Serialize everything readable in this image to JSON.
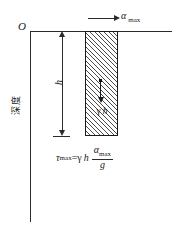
{
  "figure": {
    "axes": {
      "origin_label": "O",
      "depth_axis_label": "深度"
    },
    "top_arrow": {
      "icon": "right-arrow-icon",
      "symbol": "α",
      "subscript": "max",
      "label": "α max"
    },
    "column": {
      "hatch_style": "diagonal-45",
      "height_dimension": {
        "label": "h",
        "icon": "double-headed-vertical-arrow-icon"
      },
      "body_force": {
        "icon": "down-arrow-icon",
        "symbol": "γ",
        "variable": "h",
        "label": "γ h"
      }
    },
    "equation": {
      "lhs_symbol": "τ",
      "lhs_subscript": "max",
      "equals": "=",
      "factor_gamma": "γ",
      "factor_h": "h",
      "numerator_symbol": "α",
      "numerator_subscript": "max",
      "denominator": "g",
      "plain_text": "τ max = γ h · α max / g"
    },
    "colors": {
      "line": "#2a2a2a",
      "hatch": "#4a4a4a",
      "background": "#ffffff"
    }
  }
}
